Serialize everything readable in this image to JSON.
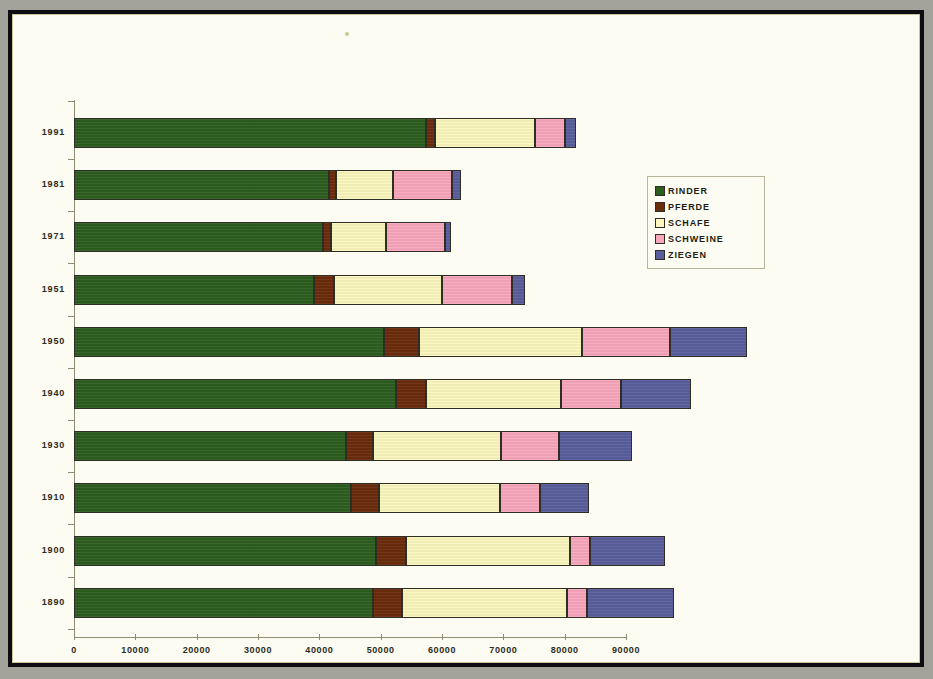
{
  "chart_data": {
    "type": "bar",
    "orientation": "horizontal",
    "stacked": true,
    "title": "",
    "xlabel": "",
    "ylabel": "",
    "grid": false,
    "legend_position": "right",
    "xlim": [
      0,
      90000
    ],
    "xticks": [
      0,
      10000,
      20000,
      30000,
      40000,
      50000,
      60000,
      70000,
      80000,
      90000
    ],
    "xtick_labels": [
      "0",
      "10000",
      "20000",
      "30000",
      "40000",
      "50000",
      "60000",
      "70000",
      "80000",
      "90000"
    ],
    "categories": [
      "1991",
      "1981",
      "1971",
      "1951",
      "1950",
      "1940",
      "1930",
      "1910",
      "1900",
      "1890"
    ],
    "series": [
      {
        "name": "RINDER",
        "color": "#2d5e20",
        "values": [
          57400,
          41600,
          40600,
          39100,
          50600,
          52500,
          44400,
          45200,
          49300,
          48800
        ]
      },
      {
        "name": "PFERDE",
        "color": "#6b2c0c",
        "values": [
          1500,
          1100,
          1300,
          3300,
          5700,
          4900,
          4400,
          4600,
          4900,
          4600
        ]
      },
      {
        "name": "SCHAFE",
        "color": "#fbf7bd",
        "values": [
          16200,
          9300,
          9000,
          17600,
          26600,
          22000,
          20900,
          19600,
          26600,
          26900
        ]
      },
      {
        "name": "SCHWEINE",
        "color": "#f9a7bd",
        "values": [
          4900,
          9600,
          9600,
          11400,
          14200,
          9800,
          9300,
          6500,
          3300,
          3300
        ]
      },
      {
        "name": "ZIEGEN",
        "color": "#5a5e9c",
        "values": [
          1800,
          1500,
          1000,
          2100,
          12600,
          11400,
          11900,
          8000,
          12200,
          14200
        ]
      }
    ],
    "totals": [
      81800,
      63100,
      61500,
      73500,
      109700,
      100600,
      90900,
      83900,
      96300,
      97800
    ]
  },
  "legend": {
    "items": [
      {
        "label": "RINDER",
        "color": "#2d5e20"
      },
      {
        "label": "PFERDE",
        "color": "#6b2c0c"
      },
      {
        "label": "SCHAFE",
        "color": "#fbf7bd"
      },
      {
        "label": "SCHWEINE",
        "color": "#f9a7bd"
      },
      {
        "label": "ZIEGEN",
        "color": "#5a5e9c"
      }
    ]
  }
}
